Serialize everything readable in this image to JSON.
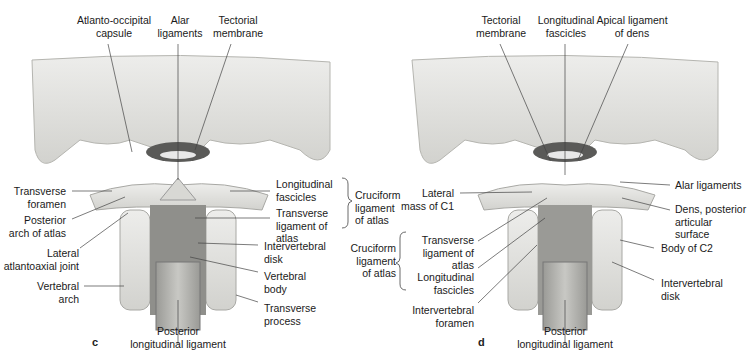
{
  "panels": [
    {
      "letter": "c",
      "labels": {
        "atlanto_occipital_capsule": "Atlanto-occipital\ncapsule",
        "alar_ligaments": "Alar\nligaments",
        "tectorial_membrane": "Tectorial\nmembrane",
        "transverse_foramen": "Transverse\nforamen",
        "posterior_arch_of_atlas": "Posterior\narch of atlas",
        "lateral_atlantoaxial_joint": "Lateral\natlantoaxial joint",
        "vertebral_arch": "Vertebral\narch",
        "longitudinal_fascicles": "Longitudinal\nfascicles",
        "transverse_ligament_of_atlas": "Transverse\nligament of\natlas",
        "cruciform_ligament_of_atlas": "Cruciform\nligament\nof atlas",
        "intervertebral_disk": "Intervertebral\ndisk",
        "vertebral_body": "Vertebral\nbody",
        "transverse_process": "Transverse\nprocess",
        "posterior_longitudinal_ligament": "Posterior\nlongitudinal ligament"
      }
    },
    {
      "letter": "d",
      "labels": {
        "tectorial_membrane": "Tectorial\nmembrane",
        "longitudinal_fascicles_top": "Longitudinal\nfascicles",
        "apical_ligament_of_dens": "Apical ligament\nof dens",
        "lateral_mass_of_c1": "Lateral\nmass of C1",
        "cruciform_ligament_of_atlas": "Cruciform\nligament\nof atlas",
        "transverse_ligament_of_atlas": "Transverse\nligament of\natlas",
        "longitudinal_fascicles": "Longitudinal\nfascicles",
        "intervertebral_foramen": "Intervertebral\nforamen",
        "alar_ligaments": "Alar ligaments",
        "dens_posterior_articular_surface": "Dens, posterior\narticular\nsurface",
        "body_of_c2": "Body of C2",
        "intervertebral_disk": "Intervertebral\ndisk",
        "posterior_longitudinal_ligament": "Posterior\nlongitudinal ligament"
      }
    }
  ],
  "colors": {
    "bone": "#e6e6e2",
    "bone_shadow": "#b9b9b4",
    "ligament_dark": "#8e8e8a",
    "leader_line": "#444444"
  }
}
